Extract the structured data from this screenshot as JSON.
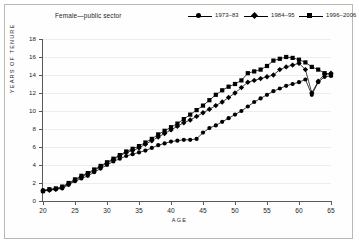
{
  "chart_title": "Female—public sector",
  "axis": {
    "ylabel": "YEARS OF TENURE",
    "xlabel": "AGE",
    "yticks": [
      0,
      2,
      4,
      6,
      8,
      10,
      12,
      14,
      16,
      18
    ],
    "xticks": [
      20,
      25,
      30,
      35,
      40,
      45,
      50,
      55,
      60,
      65
    ]
  },
  "legend": [
    {
      "label": "1973–83",
      "marker": "circle-marker"
    },
    {
      "label": "1984–95",
      "marker": "diamond-marker"
    },
    {
      "label": "1996–2006",
      "marker": "square-marker"
    }
  ],
  "chart_data": {
    "type": "line",
    "title": "Female—public sector",
    "xlabel": "AGE",
    "ylabel": "YEARS OF TENURE",
    "xlim": [
      20,
      65
    ],
    "ylim": [
      0,
      18
    ],
    "grid": true,
    "legend_position": "top-right",
    "x": [
      20,
      21,
      22,
      23,
      24,
      25,
      26,
      27,
      28,
      29,
      30,
      31,
      32,
      33,
      34,
      35,
      36,
      37,
      38,
      39,
      40,
      41,
      42,
      43,
      44,
      45,
      46,
      47,
      48,
      49,
      50,
      51,
      52,
      53,
      54,
      55,
      56,
      57,
      58,
      59,
      60,
      61,
      62,
      63,
      64,
      65
    ],
    "series": [
      {
        "name": "1973–83",
        "marker": "circle",
        "values": [
          1.2,
          1.3,
          1.3,
          1.4,
          1.8,
          2.2,
          2.5,
          2.8,
          3.2,
          3.6,
          4.0,
          4.4,
          4.7,
          5.0,
          5.2,
          5.4,
          5.6,
          5.9,
          6.2,
          6.4,
          6.6,
          6.7,
          6.8,
          6.8,
          6.9,
          7.6,
          8.1,
          8.4,
          8.8,
          9.2,
          9.6,
          10.0,
          10.5,
          11.0,
          11.4,
          11.8,
          12.2,
          12.5,
          12.8,
          13.0,
          13.2,
          13.5,
          11.8,
          13.2,
          13.8,
          13.9
        ]
      },
      {
        "name": "1984–95",
        "marker": "diamond",
        "values": [
          1.1,
          1.2,
          1.3,
          1.5,
          1.9,
          2.3,
          2.7,
          3.0,
          3.4,
          3.8,
          4.2,
          4.6,
          5.0,
          5.4,
          5.6,
          5.9,
          6.3,
          6.7,
          7.1,
          7.5,
          7.9,
          8.3,
          8.7,
          9.0,
          9.4,
          9.8,
          10.2,
          10.6,
          11.0,
          11.5,
          12.0,
          12.6,
          13.2,
          13.4,
          13.6,
          13.8,
          14.0,
          14.6,
          14.9,
          15.1,
          15.3,
          14.6,
          12.0,
          13.3,
          14.1,
          14.2
        ]
      },
      {
        "name": "1996–2006",
        "marker": "square",
        "values": [
          1.1,
          1.3,
          1.4,
          1.6,
          2.0,
          2.4,
          2.8,
          3.1,
          3.5,
          3.9,
          4.3,
          4.7,
          5.1,
          5.5,
          5.8,
          6.1,
          6.5,
          6.9,
          7.4,
          7.8,
          8.2,
          8.6,
          9.1,
          9.6,
          10.1,
          10.6,
          11.2,
          11.8,
          12.3,
          12.7,
          13.0,
          13.4,
          14.2,
          14.4,
          14.6,
          15.0,
          15.6,
          15.8,
          16.0,
          15.9,
          15.7,
          15.4,
          14.9,
          14.6,
          14.2,
          14.0
        ]
      }
    ]
  }
}
